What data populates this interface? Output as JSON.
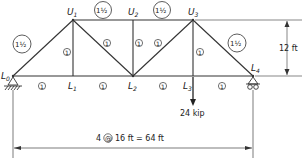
{
  "diagram": {
    "type": "truss",
    "nodes": {
      "L0": {
        "label": "L",
        "sub": "0"
      },
      "L1": {
        "label": "L",
        "sub": "1"
      },
      "L2": {
        "label": "L",
        "sub": "2"
      },
      "L3": {
        "label": "L",
        "sub": "3"
      },
      "L4": {
        "label": "L",
        "sub": "4"
      },
      "U1": {
        "label": "U",
        "sub": "1"
      },
      "U2": {
        "label": "U",
        "sub": "2"
      },
      "U3": {
        "label": "U",
        "sub": "3"
      }
    },
    "member_tags": {
      "L0U1": "1½",
      "U1U2": "1½",
      "U2U3": "1½",
      "U3L4": "1½",
      "U1L1": "1",
      "U1L2": "1",
      "U2L2": "1",
      "L2U3": "1",
      "U3L3": "1",
      "L0L1": "1",
      "L1L2": "1",
      "L2L3": "1",
      "L3L4": "1"
    },
    "load": "24 kip",
    "height_dim": "12 ft",
    "span_dim": {
      "prefix": "4",
      "at": "@",
      "suffix": "16 ft = 64 ft"
    }
  }
}
